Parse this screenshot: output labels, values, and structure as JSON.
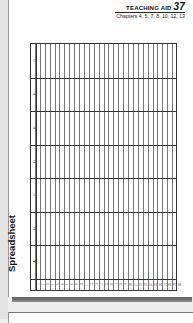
{
  "header": {
    "title": "TEACHING AID",
    "number": "37",
    "chapters": "Chapters 4, 5, 7, 8, 10, 12, 13"
  },
  "sheet": {
    "label": "Spreadsheet",
    "columns": [
      "A",
      "B",
      "C",
      "D",
      "E",
      "F",
      "G"
    ],
    "rows": [
      "1",
      "2",
      "3",
      "4",
      "5",
      "6",
      "7",
      "8",
      "9",
      "10",
      "11",
      "12",
      "13",
      "14",
      "15",
      "16",
      "17",
      "18",
      "19",
      "20",
      "21",
      "22",
      "23",
      "24",
      "25",
      "26",
      "27",
      "28",
      "29",
      "30"
    ]
  },
  "colors": {
    "grid_line": "#333333",
    "row_line": "#777777",
    "bottom_bar": "#6e6e6e"
  }
}
